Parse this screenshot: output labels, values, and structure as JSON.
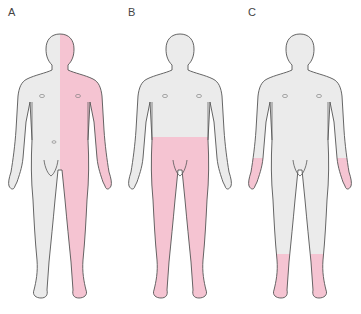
{
  "colors": {
    "skin": "#ebebeb",
    "affected": "#f5c4d2",
    "outline": "#555555"
  },
  "panels": [
    {
      "label": "A",
      "affected_region": "right hemibody (vertical split at midline)"
    },
    {
      "label": "B",
      "affected_region": "both lower limbs below waist"
    },
    {
      "label": "C",
      "affected_region": "both hands and both lower legs/feet (glove and stocking)"
    }
  ]
}
